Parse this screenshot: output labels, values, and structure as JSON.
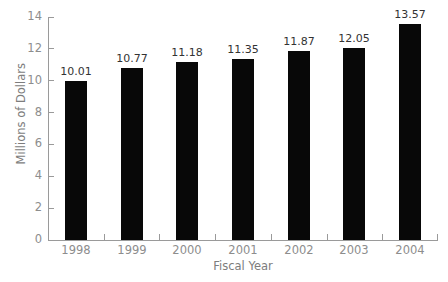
{
  "chart_data": {
    "type": "bar",
    "title": "",
    "subtitle": "",
    "xlabel": "Fiscal Year",
    "ylabel": "Millions of Dollars",
    "categories": [
      "1998",
      "1999",
      "2000",
      "2001",
      "2002",
      "2003",
      "2004"
    ],
    "values": [
      10.01,
      10.77,
      11.18,
      11.35,
      11.87,
      12.05,
      13.57
    ],
    "value_labels": [
      "10.01",
      "10.77",
      "11.18",
      "11.35",
      "11.87",
      "12.05",
      "13.57"
    ],
    "ylim": [
      0,
      14
    ],
    "yticks": [
      0,
      2,
      4,
      6,
      8,
      10,
      12,
      14
    ],
    "ytick_labels": [
      "0",
      "2",
      "4",
      "6",
      "8",
      "10",
      "12",
      "14"
    ],
    "grid": false,
    "legend": false,
    "legend_position": "none",
    "bar_color": "#080808",
    "axis_color": "#9a9a9a",
    "tick_label_color": "#8d8d8d",
    "value_label_color": "#333333",
    "background_color": "#ffffff"
  }
}
